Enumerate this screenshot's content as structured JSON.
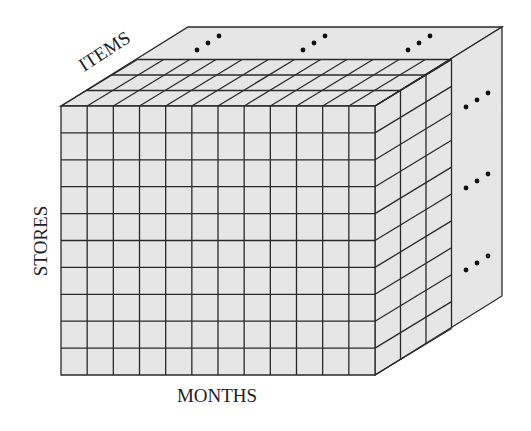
{
  "diagram": {
    "labels": {
      "items": "ITEMS",
      "stores": "STORES",
      "months": "MONTHS"
    },
    "grid": {
      "months_columns": 12,
      "stores_rows": 10,
      "items_layers_shown": 3
    },
    "ellipsis": "...",
    "colors": {
      "face_fill": "#e6e6e6",
      "line": "#2a2a2a",
      "background": "#ffffff"
    }
  }
}
